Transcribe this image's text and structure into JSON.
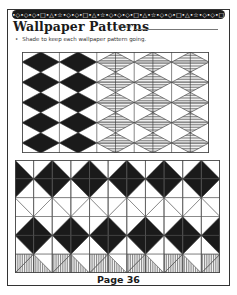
{
  "header": {
    "banner_text": "•◇•◇•◇•□•△•☆•◇•◇•□•△•☆•◇•◇•◇•□•△•☆•◇•◇•□•△•☆•◇•◇•□•",
    "title": "Wallpaper Patterns",
    "name_label": "Name"
  },
  "instruction": {
    "bullet": "•",
    "text": "Shade to keep each wallpaper pattern going."
  },
  "patterns": [
    {
      "id": "diamond-pattern",
      "columns": 5,
      "rows": 5,
      "shaded_solid_columns": 2,
      "hatched_columns": 3,
      "solid_color": "#1a1a1a",
      "hatch_color": "#777777"
    },
    {
      "id": "zigzag-pattern",
      "columns": 11,
      "rows": 6,
      "solid_color": "#1a1a1a",
      "hatch_color": "#888888"
    }
  ],
  "footer": {
    "page_label": "Page 36"
  }
}
